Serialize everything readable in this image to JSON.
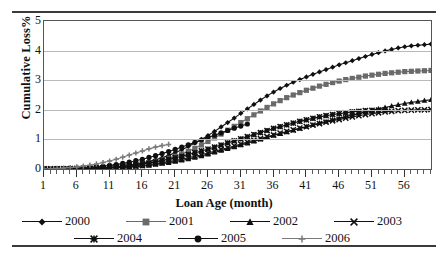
{
  "figure": {
    "ylabel": "Cumulative Loss%",
    "xlabel": "Loan Age (month)"
  },
  "legend": {
    "items": [
      {
        "label": "2000",
        "marker": "diamond",
        "color": "#101010"
      },
      {
        "label": "2001",
        "marker": "square",
        "color": "#6a6a6a"
      },
      {
        "label": "2002",
        "marker": "triangle",
        "color": "#101010"
      },
      {
        "label": "2003",
        "marker": "x",
        "color": "#101010"
      },
      {
        "label": "2004",
        "marker": "star",
        "color": "#101010"
      },
      {
        "label": "2005",
        "marker": "circle",
        "color": "#101010"
      },
      {
        "label": "2006",
        "marker": "plus",
        "color": "#7a7a7a"
      }
    ]
  },
  "chart_data": {
    "type": "line",
    "title": "",
    "xlabel": "Loan Age (month)",
    "ylabel": "Cumulative Loss%",
    "xlim": [
      1,
      60
    ],
    "ylim": [
      0,
      5
    ],
    "yticks": [
      0,
      1,
      2,
      3,
      4,
      5
    ],
    "xticks": [
      1,
      6,
      11,
      16,
      21,
      26,
      31,
      36,
      41,
      46,
      51,
      56
    ],
    "grid": "horizontal",
    "legend_position": "below",
    "x": [
      1,
      2,
      3,
      4,
      5,
      6,
      7,
      8,
      9,
      10,
      11,
      12,
      13,
      14,
      15,
      16,
      17,
      18,
      19,
      20,
      21,
      22,
      23,
      24,
      25,
      26,
      27,
      28,
      29,
      30,
      31,
      32,
      33,
      34,
      35,
      36,
      37,
      38,
      39,
      40,
      41,
      42,
      43,
      44,
      45,
      46,
      47,
      48,
      49,
      50,
      51,
      52,
      53,
      54,
      55,
      56,
      57,
      58,
      59,
      60
    ],
    "series": [
      {
        "name": "2000",
        "marker": "diamond",
        "color": "#101010",
        "values": [
          0,
          0,
          0,
          0.01,
          0.01,
          0.02,
          0.02,
          0.03,
          0.04,
          0.05,
          0.06,
          0.08,
          0.1,
          0.13,
          0.16,
          0.2,
          0.25,
          0.31,
          0.38,
          0.46,
          0.55,
          0.65,
          0.76,
          0.88,
          1.0,
          1.13,
          1.27,
          1.42,
          1.57,
          1.72,
          1.88,
          2.03,
          2.18,
          2.33,
          2.47,
          2.6,
          2.72,
          2.83,
          2.93,
          3.02,
          3.11,
          3.2,
          3.28,
          3.36,
          3.44,
          3.52,
          3.59,
          3.66,
          3.73,
          3.8,
          3.87,
          3.93,
          3.99,
          4.04,
          4.09,
          4.13,
          4.16,
          4.18,
          4.2,
          4.22
        ]
      },
      {
        "name": "2001",
        "marker": "square",
        "color": "#6a6a6a",
        "values": [
          0,
          0,
          0,
          0,
          0.01,
          0.01,
          0.02,
          0.02,
          0.03,
          0.04,
          0.05,
          0.06,
          0.08,
          0.1,
          0.13,
          0.16,
          0.2,
          0.25,
          0.3,
          0.36,
          0.43,
          0.51,
          0.6,
          0.7,
          0.81,
          0.93,
          1.05,
          1.18,
          1.31,
          1.44,
          1.57,
          1.7,
          1.83,
          1.96,
          2.08,
          2.2,
          2.31,
          2.41,
          2.5,
          2.58,
          2.66,
          2.73,
          2.8,
          2.86,
          2.92,
          2.97,
          3.02,
          3.06,
          3.1,
          3.14,
          3.17,
          3.2,
          3.23,
          3.25,
          3.27,
          3.29,
          3.3,
          3.31,
          3.32,
          3.33
        ]
      },
      {
        "name": "2002",
        "marker": "triangle",
        "color": "#101010",
        "values": [
          0,
          0,
          0,
          0,
          0,
          0.01,
          0.01,
          0.01,
          0.02,
          0.02,
          0.03,
          0.04,
          0.05,
          0.06,
          0.08,
          0.1,
          0.12,
          0.15,
          0.18,
          0.21,
          0.25,
          0.29,
          0.34,
          0.39,
          0.44,
          0.5,
          0.56,
          0.62,
          0.68,
          0.74,
          0.81,
          0.87,
          0.94,
          1.0,
          1.06,
          1.13,
          1.19,
          1.25,
          1.31,
          1.37,
          1.43,
          1.49,
          1.55,
          1.6,
          1.66,
          1.71,
          1.77,
          1.82,
          1.87,
          1.93,
          1.98,
          2.03,
          2.08,
          2.13,
          2.17,
          2.21,
          2.25,
          2.28,
          2.31,
          2.34
        ]
      },
      {
        "name": "2003",
        "marker": "x",
        "color": "#101010",
        "values": [
          0,
          0,
          0,
          0,
          0,
          0.01,
          0.01,
          0.02,
          0.02,
          0.03,
          0.04,
          0.05,
          0.06,
          0.08,
          0.1,
          0.12,
          0.15,
          0.18,
          0.21,
          0.25,
          0.29,
          0.33,
          0.38,
          0.43,
          0.48,
          0.54,
          0.6,
          0.66,
          0.72,
          0.78,
          0.84,
          0.91,
          0.97,
          1.03,
          1.09,
          1.15,
          1.21,
          1.27,
          1.32,
          1.38,
          1.43,
          1.48,
          1.53,
          1.58,
          1.63,
          1.67,
          1.72,
          1.76,
          1.8,
          1.84,
          1.87,
          1.9,
          1.93,
          1.95,
          1.97,
          1.98,
          1.99,
          2.0,
          2.0,
          2.01
        ]
      },
      {
        "name": "2004",
        "marker": "star",
        "color": "#101010",
        "values": [
          0,
          0,
          0,
          0,
          0.01,
          0.01,
          0.02,
          0.02,
          0.03,
          0.04,
          0.06,
          0.07,
          0.09,
          0.11,
          0.14,
          0.17,
          0.2,
          0.24,
          0.28,
          0.33,
          0.38,
          0.43,
          0.49,
          0.55,
          0.61,
          0.67,
          0.74,
          0.81,
          0.88,
          0.95,
          1.02,
          1.09,
          1.16,
          1.23,
          1.3,
          1.37,
          1.43,
          1.49,
          1.55,
          1.61,
          1.66,
          1.71,
          1.76,
          1.8,
          1.84,
          1.87,
          1.9,
          1.93,
          1.95,
          1.97,
          1.98,
          1.99,
          2.0,
          null,
          null,
          null,
          null,
          null,
          null,
          null
        ]
      },
      {
        "name": "2005",
        "marker": "circle",
        "color": "#101010",
        "values": [
          0,
          0,
          0.01,
          0.01,
          0.02,
          0.03,
          0.04,
          0.05,
          0.07,
          0.09,
          0.12,
          0.15,
          0.19,
          0.23,
          0.28,
          0.33,
          0.39,
          0.45,
          0.52,
          0.59,
          0.66,
          0.74,
          0.82,
          0.9,
          0.98,
          1.06,
          1.14,
          1.22,
          1.3,
          1.38,
          1.45,
          1.52,
          null,
          null,
          null,
          null,
          null,
          null,
          null,
          null,
          null,
          null,
          null,
          null,
          null,
          null,
          null,
          null,
          null,
          null,
          null,
          null,
          null,
          null,
          null,
          null,
          null,
          null,
          null,
          null
        ]
      },
      {
        "name": "2006",
        "marker": "plus",
        "color": "#7a7a7a",
        "values": [
          0,
          0.01,
          0.02,
          0.03,
          0.05,
          0.07,
          0.1,
          0.13,
          0.17,
          0.22,
          0.27,
          0.33,
          0.4,
          0.47,
          0.54,
          0.61,
          0.68,
          0.74,
          0.79,
          0.83,
          null,
          null,
          null,
          null,
          null,
          null,
          null,
          null,
          null,
          null,
          null,
          null,
          null,
          null,
          null,
          null,
          null,
          null,
          null,
          null,
          null,
          null,
          null,
          null,
          null,
          null,
          null,
          null,
          null,
          null,
          null,
          null,
          null,
          null,
          null,
          null,
          null,
          null,
          null,
          null
        ]
      }
    ]
  }
}
